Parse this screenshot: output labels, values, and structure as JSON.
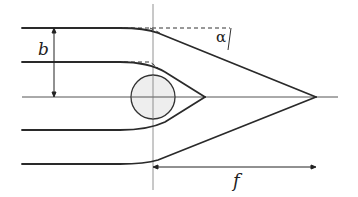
{
  "diagram": {
    "type": "lens-focusing-ray-diagram",
    "labels": {
      "impact_parameter": "b",
      "deflection_angle": "α",
      "focal_length": "f"
    },
    "colors": {
      "line": "#2a2a2a",
      "axis": "#555555",
      "dashed": "#333333",
      "lens_fill": "#eeeeee",
      "background": "#ffffff"
    },
    "elements": [
      "optical-axis",
      "lens-plane-vertical-line",
      "spherical-lens-circle",
      "incoming-ray-top",
      "incoming-ray-second",
      "incoming-ray-fourth",
      "incoming-ray-bottom",
      "undeflected-dashed-guides",
      "impact-parameter-arrow",
      "focal-length-arrow"
    ]
  }
}
